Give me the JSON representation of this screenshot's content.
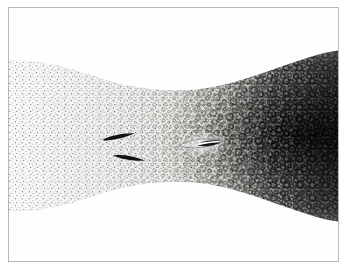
{
  "figure": {
    "kind": "engraving-plate",
    "title": "",
    "caption": "",
    "medium": "stipple engraving / halftone micrograph",
    "frame": {
      "border_color": "#b9b9b4",
      "paper_color": "#ffffff",
      "plate_color": "#fefefe"
    },
    "band": {
      "name": "tissue-band",
      "shape": "hourglass-waisted horizontal band",
      "top_edge": "dips toward center",
      "bottom_edge": "rises toward center",
      "left_margin_tone": "#f4f4f2",
      "right_margin_tone": "#3a3a38"
    },
    "gradient": {
      "description": "stipple density increases left to right",
      "light_end": "left",
      "dark_end": "right",
      "light_hex": "#f2f2f0",
      "mid_hex": "#c9c9c6",
      "dark_hex": "#2e2e2c"
    },
    "texture": {
      "left_motif": "fine sparse dots",
      "right_motif": "dense dark rings / vacuoles",
      "ring_color": "#242422",
      "dot_color": "#4a4a48"
    },
    "inclusions": [
      {
        "id": "inclusion-upper-left",
        "label": "dark spindle body, upper",
        "x_pct": 33.5,
        "y_pct": 50.5,
        "length_px": 34,
        "thickness_px": 5,
        "angle_deg": -9,
        "color": "#111110"
      },
      {
        "id": "inclusion-lower-left",
        "label": "dark spindle body, lower",
        "x_pct": 36.5,
        "y_pct": 58.5,
        "length_px": 32,
        "thickness_px": 5,
        "angle_deg": 7,
        "color": "#111110"
      },
      {
        "id": "inclusion-right",
        "label": "dark sliver with pale lumen in lens-shaped outline",
        "x_pct": 58.5,
        "y_pct": 53.0,
        "length_px": 30,
        "thickness_px": 4,
        "angle_deg": -4,
        "color": "#131312",
        "lumen_color": "#ffffff"
      }
    ]
  }
}
